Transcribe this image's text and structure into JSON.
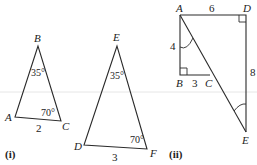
{
  "figures": [
    {
      "id": "i",
      "label": "(i)",
      "triangles": [
        {
          "name": "ABC",
          "vertices": {
            "A": "A",
            "B": "B",
            "C": "C"
          },
          "angles": {
            "B": "35°",
            "C": "70°"
          },
          "sides": {
            "AC": "2"
          }
        },
        {
          "name": "DEF",
          "vertices": {
            "D": "D",
            "E": "E",
            "F": "F"
          },
          "angles": {
            "E": "35°",
            "F": "70°"
          },
          "sides": {
            "DF": "3"
          }
        }
      ]
    },
    {
      "id": "ii",
      "label": "(ii)",
      "vertices": {
        "A": "A",
        "B": "B",
        "C": "C",
        "D": "D",
        "E": "E"
      },
      "sides": {
        "AD": "6",
        "AB": "4",
        "BC": "3",
        "DE": "8"
      },
      "right_angles": [
        "B",
        "D"
      ],
      "marked_angles": [
        "BAC",
        "DEA"
      ]
    }
  ]
}
